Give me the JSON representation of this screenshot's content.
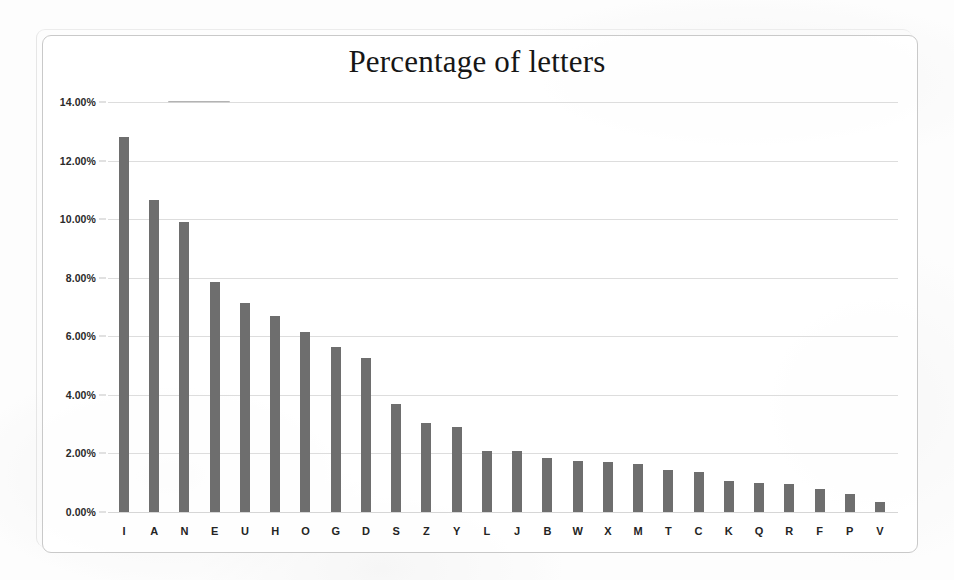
{
  "chart_data": {
    "type": "bar",
    "title": "Percentage of letters",
    "xlabel": "",
    "ylabel": "",
    "ylim": [
      0,
      14
    ],
    "grid": true,
    "legend": "none",
    "y_ticks": [
      "0.00%",
      "2.00%",
      "4.00%",
      "6.00%",
      "8.00%",
      "10.00%",
      "12.00%",
      "14.00%"
    ],
    "y_tick_values": [
      0,
      2,
      4,
      6,
      8,
      10,
      12,
      14
    ],
    "categories": [
      "I",
      "A",
      "N",
      "E",
      "U",
      "H",
      "O",
      "G",
      "D",
      "S",
      "Z",
      "Y",
      "L",
      "J",
      "B",
      "W",
      "X",
      "M",
      "T",
      "C",
      "K",
      "Q",
      "R",
      "F",
      "P",
      "V"
    ],
    "values": [
      12.8,
      10.65,
      9.9,
      7.85,
      7.15,
      6.7,
      6.15,
      5.65,
      5.25,
      3.7,
      3.05,
      2.9,
      2.1,
      2.1,
      1.85,
      1.75,
      1.7,
      1.65,
      1.45,
      1.35,
      1.05,
      1.0,
      0.95,
      0.8,
      0.6,
      0.35
    ],
    "bar_color": "#6e6e6e",
    "grid_color": "#d7d7d7",
    "frame_color": "#c9c9c9",
    "background": "#ffffff"
  }
}
